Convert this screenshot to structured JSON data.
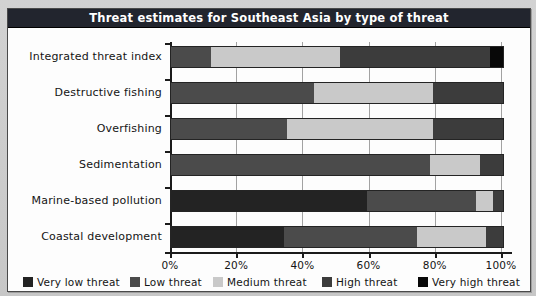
{
  "figure": {
    "title": "Threat estimates for Southeast Asia by type of threat"
  },
  "colors": {
    "title_bar_bg": "#22252e",
    "title_text": "#ffffff",
    "panel_bg": "#fdfdfd",
    "page_bg": "#c9c9c9",
    "gridline": "#a2a2a2",
    "axis": "#1b1b1b",
    "very_low_threat": "#232323",
    "low_threat": "#4b4b4b",
    "medium_threat": "#c9c9c9",
    "high_threat": "#3c3c3c",
    "very_high_threat": "#080808"
  },
  "chart_data": {
    "type": "bar",
    "orientation": "horizontal",
    "stacked": true,
    "title": "Threat estimates for Southeast Asia by type of threat",
    "categories": [
      "Integrated threat index",
      "Destructive fishing",
      "Overfishing",
      "Sedimentation",
      "Marine-based pollution",
      "Coastal development"
    ],
    "series": [
      {
        "name": "Very low threat",
        "color": "#232323",
        "values": [
          0,
          0,
          0,
          0,
          59,
          34
        ]
      },
      {
        "name": "Low threat",
        "color": "#4b4b4b",
        "values": [
          12,
          43,
          35,
          78,
          33,
          40
        ]
      },
      {
        "name": "Medium threat",
        "color": "#c9c9c9",
        "values": [
          39,
          36,
          44,
          15,
          5,
          21
        ]
      },
      {
        "name": "High threat",
        "color": "#3c3c3c",
        "values": [
          45,
          21,
          21,
          7,
          3,
          5
        ]
      },
      {
        "name": "Very high threat",
        "color": "#080808",
        "values": [
          4,
          0,
          0,
          0,
          0,
          0
        ]
      }
    ],
    "x_tick_labels": [
      "0%",
      "20%",
      "40%",
      "60%",
      "80%",
      "100%"
    ],
    "xlim": [
      0,
      100
    ],
    "grid": true,
    "legend_position": "bottom"
  }
}
